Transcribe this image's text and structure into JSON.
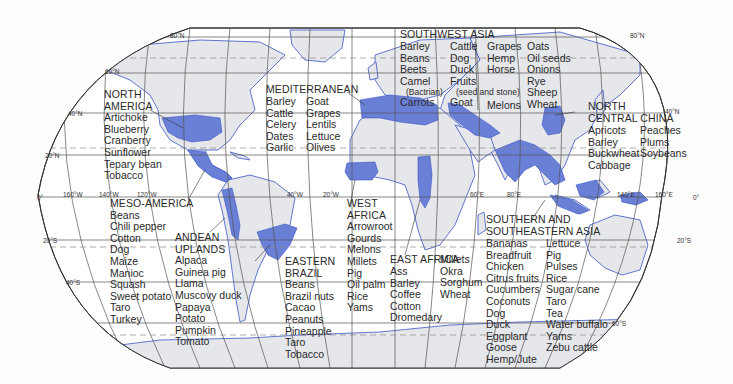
{
  "map": {
    "projection": "Robinson",
    "colors": {
      "ocean": "#ffffff",
      "land": "#e6e7ea",
      "domestication_region": "#6a7fd6",
      "coastline": "#3a56c6",
      "grid": "#555555",
      "border": "#888888",
      "tropic_dashed": "#8a8a8a",
      "text": "#2a2a2a"
    },
    "latitude_labels": [
      "80°N",
      "60°N",
      "40°N",
      "20°N",
      "0°",
      "20°S",
      "40°S",
      "20°S",
      "60°S",
      "80°N",
      "40°N",
      "0°"
    ],
    "longitude_labels": [
      "160°W",
      "140°W",
      "120°W",
      "40°W",
      "20°W",
      "60°E",
      "80°E",
      "140°E",
      "160°E"
    ]
  },
  "regions": {
    "north_america": {
      "title_lines": [
        "NORTH",
        "AMERICA"
      ],
      "items": [
        "Artichoke",
        "Blueberry",
        "Cranberry",
        "Sunflower",
        "Tepary bean",
        "Tobacco"
      ]
    },
    "meso_america": {
      "title": "MESO-AMERICA",
      "items": [
        "Beans",
        "Chili pepper",
        "Cotton",
        "Dog",
        "Maize",
        "Manioc",
        "Squash",
        "Sweet potato",
        "Taro",
        "Turkey"
      ]
    },
    "andean_uplands": {
      "title_lines": [
        "ANDEAN",
        "UPLANDS"
      ],
      "items": [
        "Alpaca",
        "Guinea pig",
        "Llama",
        "Muscovy duck",
        "Papaya",
        "Potato",
        "Pumpkin",
        "Tomato"
      ]
    },
    "eastern_brazil": {
      "title_lines": [
        "EASTERN",
        "BRAZIL"
      ],
      "items": [
        "Beans",
        "Brazil nuts",
        "Cacao",
        "Peanuts",
        "Pineapple",
        "Taro",
        "Tobacco"
      ]
    },
    "mediterranean": {
      "title": "MEDITERRANEAN",
      "col1": [
        "Barley",
        "Cattle",
        "Celery",
        "Dates",
        "Garlic"
      ],
      "col2": [
        "Goat",
        "Grapes",
        "Lentils",
        "Lettuce",
        "Olives"
      ]
    },
    "west_africa": {
      "title_lines": [
        "WEST",
        "AFRICA"
      ],
      "items": [
        "Arrowroot",
        "Gourds",
        "Melons",
        "Millets",
        "Pig",
        "Oil palm",
        "Rice",
        "Yams"
      ]
    },
    "east_africa": {
      "title": "EAST AFRICA",
      "col1": [
        "Ass",
        "Barley",
        "Coffee",
        "Cotton",
        "Dromedary"
      ],
      "col2": [
        "Millets",
        "Okra",
        "Sorghum",
        "Wheat"
      ]
    },
    "southwest_asia": {
      "title": "SOUTHWEST ASIA",
      "col1": [
        "Barley",
        "Beans",
        "Beets",
        "Camel"
      ],
      "col1_note": "(Bactrian)",
      "col1_last": "Carrots",
      "col2": [
        "Cattle",
        "Dog",
        "Duck",
        "Fruits"
      ],
      "col2_note": "(seed and stone)",
      "col2_last": "Goat",
      "col3": [
        "Grapes",
        "Hemp",
        "Horse"
      ],
      "col3_last": "Melons",
      "col4": [
        "Oats",
        "Oil seeds",
        "Onions",
        "Rye",
        "Sheep",
        "Wheat"
      ]
    },
    "north_central_china": {
      "title_lines": [
        "NORTH",
        "CENTRAL CHINA"
      ],
      "col1": [
        "Apricots",
        "Barley",
        "Buckwheat",
        "Cabbage"
      ],
      "col2": [
        "Peaches",
        "Plums",
        "Soybeans"
      ]
    },
    "southern_southeastern_asia": {
      "title_lines": [
        "SOUTHERN AND",
        "SOUTHEASTERN ASIA"
      ],
      "col1": [
        "Bananas",
        "Breadfruit",
        "Chicken",
        "Citrus fruits",
        "Cucumbers",
        "Coconuts",
        "Dog",
        "Duck",
        "Eggplant",
        "Goose",
        "Hemp/Jute"
      ],
      "col2": [
        "Lettuce",
        "Pig",
        "Pulses",
        "Rice",
        "Sugar cane",
        "Taro",
        "Tea",
        "Water buffalo",
        "Yams",
        "Zebu cattle"
      ]
    }
  },
  "grid_text": {
    "n80_left": "80°N",
    "n80_right": "80°N",
    "n60": "60°N",
    "n40_left": "40°N",
    "n40_right": "40°N",
    "n20": "20°N",
    "eq_left": "0°",
    "eq_right": "0°",
    "s20_left": "20°S",
    "s20_right": "20°S",
    "s40_left": "40°S",
    "s60_right": "60°S",
    "w160": "160°W",
    "w140": "140°W",
    "w120": "120°W",
    "w40": "40°W",
    "w20": "20°W",
    "e60": "60°E",
    "e80": "80°E",
    "e140": "140°E",
    "e160": "160°E"
  }
}
